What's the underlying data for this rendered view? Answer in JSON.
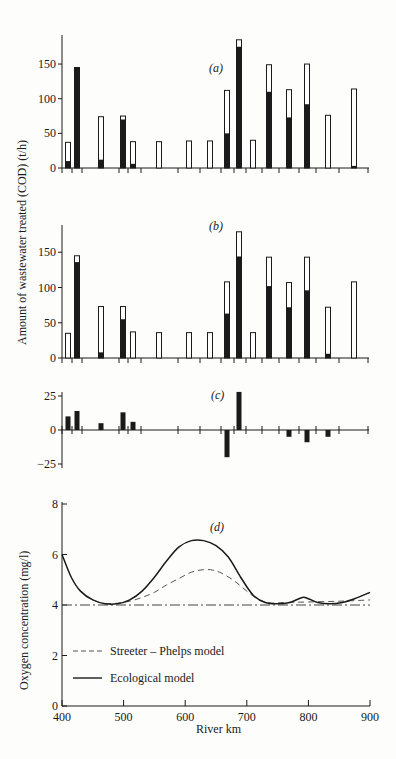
{
  "chart_data": [
    {
      "id": "a",
      "type": "bar",
      "subtype": "stacked (black = filled portion, white = remaining)",
      "panel_label": "(a)",
      "x_px": [
        68,
        77,
        101,
        123,
        133,
        159,
        189,
        210,
        227,
        239,
        253,
        269,
        289,
        307,
        328,
        354
      ],
      "totals": [
        37,
        145,
        74,
        75,
        38,
        38,
        39,
        39,
        112,
        185,
        40,
        149,
        113,
        150,
        76,
        114
      ],
      "black": [
        10,
        145,
        12,
        70,
        6,
        0,
        0,
        0,
        50,
        175,
        0,
        110,
        73,
        92,
        0,
        3
      ],
      "yticks": [
        0,
        50,
        100,
        150
      ],
      "ylim": [
        0,
        190
      ],
      "axis_ticks_x_px": [
        62,
        72,
        82,
        119,
        128,
        141,
        178,
        200,
        221,
        234,
        246,
        262,
        279,
        299,
        316,
        339,
        368
      ]
    },
    {
      "id": "b",
      "type": "bar",
      "subtype": "stacked (black = filled portion, white = remaining)",
      "panel_label": "(b)",
      "x_px": [
        68,
        77,
        101,
        123,
        133,
        159,
        189,
        210,
        227,
        239,
        253,
        269,
        289,
        307,
        328,
        354
      ],
      "totals": [
        35,
        145,
        73,
        73,
        37,
        36,
        36,
        36,
        108,
        179,
        36,
        143,
        107,
        143,
        72,
        108
      ],
      "black": [
        0,
        136,
        8,
        55,
        0,
        0,
        0,
        0,
        63,
        144,
        0,
        102,
        72,
        96,
        6,
        0
      ],
      "yticks": [
        0,
        50,
        100,
        150
      ],
      "ylim": [
        0,
        190
      ],
      "axis_ticks_x_px": [
        62,
        72,
        82,
        119,
        128,
        141,
        178,
        200,
        221,
        234,
        246,
        262,
        279,
        299,
        316,
        339,
        368
      ]
    },
    {
      "id": "c",
      "type": "bar",
      "subtype": "difference",
      "panel_label": "(c)",
      "x_px": [
        68,
        77,
        101,
        123,
        133,
        227,
        239,
        289,
        307,
        328
      ],
      "values": [
        10,
        14,
        5,
        13,
        6,
        -20,
        28,
        -5,
        -9,
        -5
      ],
      "yticks": [
        -25,
        0,
        25
      ],
      "ylim": [
        -28,
        30
      ],
      "axis_ticks_x_px": [
        62,
        72,
        82,
        119,
        128,
        141,
        178,
        200,
        221,
        234,
        246,
        262,
        279,
        299,
        316,
        339,
        368
      ]
    },
    {
      "id": "d",
      "type": "line",
      "panel_label": "(d)",
      "title": "",
      "xlabel": "River km",
      "ylabel": "Oxygen concentration (mg/l)",
      "xlim": [
        400,
        900
      ],
      "ylim": [
        0,
        8
      ],
      "xticks": [
        400,
        500,
        600,
        700,
        800,
        900
      ],
      "yticks": [
        0,
        2,
        4,
        6,
        8
      ],
      "grid": false,
      "legend_position": "lower left",
      "series": [
        {
          "name": "Ecological model",
          "style": "solid",
          "x": [
            400,
            415,
            430,
            450,
            470,
            490,
            510,
            530,
            550,
            570,
            590,
            610,
            630,
            650,
            670,
            690,
            710,
            730,
            750,
            770,
            790,
            800,
            815,
            835,
            855,
            875,
            900
          ],
          "y": [
            6.0,
            5.1,
            4.55,
            4.2,
            4.05,
            4.05,
            4.2,
            4.55,
            5.1,
            5.75,
            6.3,
            6.55,
            6.55,
            6.35,
            5.9,
            5.1,
            4.4,
            4.1,
            4.05,
            4.1,
            4.3,
            4.25,
            4.1,
            4.05,
            4.1,
            4.25,
            4.5
          ]
        },
        {
          "name": "Streeter - Phelps model",
          "style": "dashed",
          "x": [
            470,
            490,
            510,
            530,
            550,
            570,
            590,
            610,
            630,
            645,
            660,
            680,
            700,
            720,
            740,
            760,
            800,
            850,
            900
          ],
          "y": [
            4.05,
            4.07,
            4.15,
            4.3,
            4.5,
            4.8,
            5.05,
            5.3,
            5.4,
            5.38,
            5.25,
            4.95,
            4.55,
            4.2,
            4.08,
            4.1,
            4.12,
            4.15,
            4.2
          ]
        },
        {
          "name": "Reference level",
          "style": "dash-dot",
          "x": [
            400,
            900
          ],
          "y": [
            4.0,
            4.0
          ]
        }
      ]
    }
  ],
  "labels": {
    "shared_ylabel_top": "Amount of  wastewater treated (COD)  (t/h)",
    "panel_a": "(a)",
    "panel_b": "(b)",
    "panel_c": "(c)",
    "panel_d": "(d)",
    "d_ylabel": "Oxygen concentration (mg/l)",
    "d_xlabel": "River km",
    "legend_dashed": "Streeter – Phelps model",
    "legend_solid": "Ecological model"
  },
  "colors": {
    "ink": "#1a1a1a",
    "paper": "#fdfdfb",
    "dashed": "#555555"
  }
}
